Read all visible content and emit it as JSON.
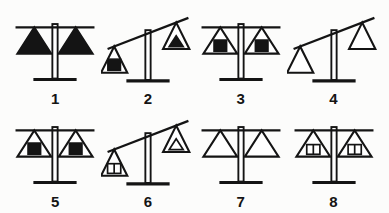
{
  "background": "#fcfcfb",
  "ink": "#141414",
  "diagram": {
    "name": "balance-scales-puzzle",
    "scales": [
      {
        "label": "1",
        "state": "balanced",
        "left": {
          "shape": "triangle",
          "fill": "solid",
          "inner": null
        },
        "right": {
          "shape": "triangle",
          "fill": "solid",
          "inner": null
        }
      },
      {
        "label": "2",
        "state": "tilted-right-up",
        "left": {
          "shape": "triangle",
          "fill": "outline",
          "inner": {
            "shape": "square",
            "fill": "solid"
          }
        },
        "right": {
          "shape": "triangle",
          "fill": "outline",
          "inner": {
            "shape": "triangle",
            "fill": "solid"
          }
        }
      },
      {
        "label": "3",
        "state": "balanced",
        "left": {
          "shape": "triangle",
          "fill": "outline",
          "inner": {
            "shape": "square",
            "fill": "solid"
          }
        },
        "right": {
          "shape": "triangle",
          "fill": "outline",
          "inner": {
            "shape": "square",
            "fill": "solid"
          }
        }
      },
      {
        "label": "4",
        "state": "tilted-right-up",
        "left": {
          "shape": "triangle",
          "fill": "outline",
          "inner": null
        },
        "right": {
          "shape": "triangle",
          "fill": "outline",
          "inner": null
        }
      },
      {
        "label": "5",
        "state": "balanced",
        "left": {
          "shape": "triangle",
          "fill": "outline",
          "inner": {
            "shape": "square",
            "fill": "solid"
          }
        },
        "right": {
          "shape": "triangle",
          "fill": "outline",
          "inner": {
            "shape": "square",
            "fill": "solid"
          }
        }
      },
      {
        "label": "6",
        "state": "tilted-right-up",
        "left": {
          "shape": "triangle",
          "fill": "outline",
          "inner": {
            "shape": "divided-square",
            "fill": "outline"
          }
        },
        "right": {
          "shape": "triangle",
          "fill": "outline",
          "inner": {
            "shape": "triangle",
            "fill": "outline"
          }
        }
      },
      {
        "label": "7",
        "state": "balanced",
        "left": {
          "shape": "triangle",
          "fill": "outline",
          "inner": null
        },
        "right": {
          "shape": "triangle",
          "fill": "outline",
          "inner": null
        }
      },
      {
        "label": "8",
        "state": "balanced",
        "left": {
          "shape": "triangle",
          "fill": "outline",
          "inner": {
            "shape": "divided-square",
            "fill": "outline"
          }
        },
        "right": {
          "shape": "triangle",
          "fill": "outline",
          "inner": {
            "shape": "divided-square",
            "fill": "outline"
          }
        }
      }
    ]
  }
}
